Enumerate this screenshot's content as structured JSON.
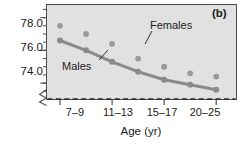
{
  "panel": {
    "label": "(b)"
  },
  "colors": {
    "plot_background": "#e1e1e1",
    "plot_border": "#4d4d4d",
    "marker": "#9a9a9a",
    "line": "#8a8a8a",
    "reference_line": "#2b2b2b",
    "text": "#1a1a1a"
  },
  "series_labels": {
    "males": "Males",
    "females": "Females"
  },
  "chart_data": {
    "type": "scatter",
    "title": "",
    "subtitle": "",
    "xlabel": "Age (yr)",
    "ylabel": "",
    "panel_label": "(b)",
    "categories": [
      "7–9",
      "11–13",
      "15–17",
      "20–25"
    ],
    "xtick_labels": [
      "7–9",
      "11–13",
      "15–17",
      "20–25"
    ],
    "ytick_labels": [
      "78.0",
      "76.0",
      "74.0"
    ],
    "ytick_values": [
      78.0,
      76.0,
      74.0
    ],
    "yminor_step": 0.5,
    "ylim": [
      73.0,
      78.8
    ],
    "axis_break": true,
    "grid": false,
    "legend": "inline-annotations",
    "reference_line": {
      "y": 73.0,
      "style": "dashed",
      "label": ""
    },
    "series": [
      {
        "name": "Males",
        "connected": true,
        "x": [
          1,
          2,
          3,
          4,
          5,
          6,
          7
        ],
        "values": [
          76.6,
          76.0,
          75.3,
          74.7,
          74.2,
          73.9,
          73.6
        ]
      },
      {
        "name": "Females",
        "connected": false,
        "x": [
          1,
          2,
          3,
          4,
          5,
          6,
          7
        ],
        "values": [
          77.5,
          77.0,
          76.4,
          75.5,
          75.0,
          74.6,
          74.4
        ]
      }
    ]
  }
}
